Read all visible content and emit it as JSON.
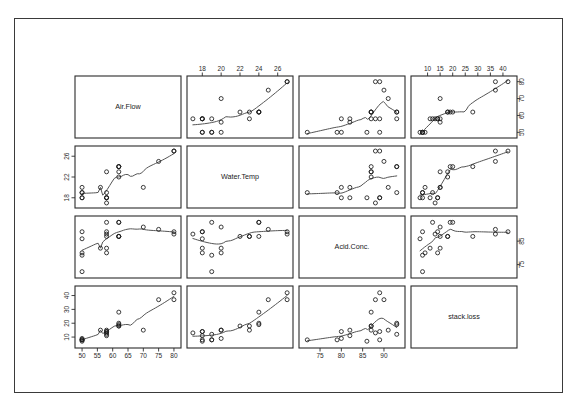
{
  "figure": {
    "type": "scatterplot-matrix",
    "variables": [
      "Air.Flow",
      "Water.Temp",
      "Acid.Conc.",
      "stack.loss"
    ],
    "has_smoother": true,
    "frame_color": "#3a3a3a",
    "point_color": "#1a1a1a",
    "smoother_color": "#555555"
  },
  "chart_data": {
    "type": "scatter",
    "title": "",
    "subtitle": "",
    "xlabel": "",
    "ylabel": "",
    "grid": false,
    "legend": "none",
    "matrix": true,
    "variables": [
      {
        "name": "Air.Flow",
        "axis_ticks": [
          50,
          55,
          60,
          65,
          70,
          75,
          80
        ],
        "axis_ticks_minor": [
          50,
          60,
          70,
          80
        ],
        "range": [
          49,
          81
        ]
      },
      {
        "name": "Water.Temp",
        "axis_ticks": [
          18,
          20,
          22,
          24,
          26
        ],
        "axis_ticks_minor": [
          18,
          22,
          26
        ],
        "range": [
          16.8,
          27.2
        ]
      },
      {
        "name": "Acid.Conc.",
        "axis_ticks": [
          75,
          80,
          85,
          90
        ],
        "axis_ticks_minor": [
          75,
          85
        ],
        "range": [
          71,
          94
        ]
      },
      {
        "name": "stack.loss",
        "axis_ticks": [
          10,
          15,
          20,
          25,
          30,
          35,
          40
        ],
        "axis_ticks_minor": [
          10,
          20,
          30,
          40
        ],
        "range": [
          5,
          44
        ]
      }
    ],
    "observations": [
      {
        "Air.Flow": 80,
        "Water.Temp": 27,
        "Acid.Conc.": 89,
        "stack.loss": 42
      },
      {
        "Air.Flow": 80,
        "Water.Temp": 27,
        "Acid.Conc.": 88,
        "stack.loss": 37
      },
      {
        "Air.Flow": 75,
        "Water.Temp": 25,
        "Acid.Conc.": 90,
        "stack.loss": 37
      },
      {
        "Air.Flow": 62,
        "Water.Temp": 24,
        "Acid.Conc.": 87,
        "stack.loss": 28
      },
      {
        "Air.Flow": 62,
        "Water.Temp": 22,
        "Acid.Conc.": 87,
        "stack.loss": 18
      },
      {
        "Air.Flow": 62,
        "Water.Temp": 23,
        "Acid.Conc.": 87,
        "stack.loss": 18
      },
      {
        "Air.Flow": 62,
        "Water.Temp": 24,
        "Acid.Conc.": 93,
        "stack.loss": 19
      },
      {
        "Air.Flow": 62,
        "Water.Temp": 24,
        "Acid.Conc.": 93,
        "stack.loss": 20
      },
      {
        "Air.Flow": 58,
        "Water.Temp": 23,
        "Acid.Conc.": 87,
        "stack.loss": 15
      },
      {
        "Air.Flow": 58,
        "Water.Temp": 18,
        "Acid.Conc.": 80,
        "stack.loss": 14
      },
      {
        "Air.Flow": 58,
        "Water.Temp": 18,
        "Acid.Conc.": 89,
        "stack.loss": 14
      },
      {
        "Air.Flow": 58,
        "Water.Temp": 17,
        "Acid.Conc.": 88,
        "stack.loss": 13
      },
      {
        "Air.Flow": 58,
        "Water.Temp": 18,
        "Acid.Conc.": 82,
        "stack.loss": 11
      },
      {
        "Air.Flow": 58,
        "Water.Temp": 19,
        "Acid.Conc.": 93,
        "stack.loss": 12
      },
      {
        "Air.Flow": 50,
        "Water.Temp": 18,
        "Acid.Conc.": 89,
        "stack.loss": 8
      },
      {
        "Air.Flow": 50,
        "Water.Temp": 18,
        "Acid.Conc.": 86,
        "stack.loss": 7
      },
      {
        "Air.Flow": 50,
        "Water.Temp": 19,
        "Acid.Conc.": 72,
        "stack.loss": 8
      },
      {
        "Air.Flow": 50,
        "Water.Temp": 19,
        "Acid.Conc.": 79,
        "stack.loss": 8
      },
      {
        "Air.Flow": 50,
        "Water.Temp": 20,
        "Acid.Conc.": 80,
        "stack.loss": 9
      },
      {
        "Air.Flow": 56,
        "Water.Temp": 20,
        "Acid.Conc.": 82,
        "stack.loss": 15
      },
      {
        "Air.Flow": 70,
        "Water.Temp": 20,
        "Acid.Conc.": 91,
        "stack.loss": 15
      }
    ]
  }
}
